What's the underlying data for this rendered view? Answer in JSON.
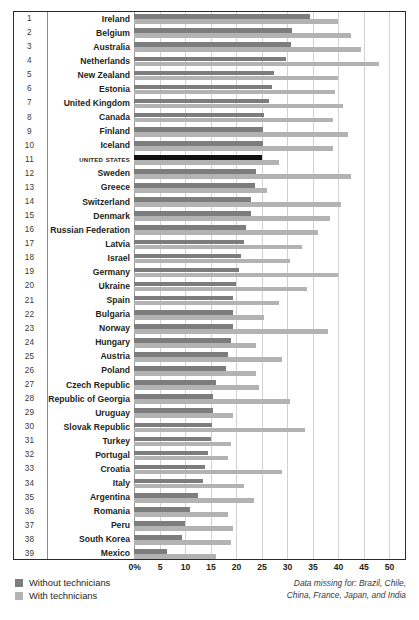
{
  "chart_data": {
    "type": "bar",
    "orientation": "horizontal",
    "title": "",
    "xlabel": "",
    "ylabel": "",
    "xlim": [
      0,
      50
    ],
    "xticks": [
      "0%",
      "5",
      "10",
      "15",
      "20",
      "25",
      "30",
      "35",
      "40",
      "45",
      "50"
    ],
    "xtick_values": [
      0,
      5,
      10,
      15,
      20,
      25,
      30,
      35,
      40,
      45,
      50
    ],
    "grid": "vertical",
    "legend_position": "bottom-left",
    "highlight_category": "United States",
    "series": [
      {
        "name": "Without technicians",
        "color": "#7d7d7d"
      },
      {
        "name": "With technicians",
        "color": "#b3b3b3"
      }
    ],
    "categories": [
      "Ireland",
      "Belgium",
      "Australia",
      "Netherlands",
      "New Zealand",
      "Estonia",
      "United Kingdom",
      "Canada",
      "Finland",
      "Iceland",
      "United States",
      "Sweden",
      "Greece",
      "Switzerland",
      "Denmark",
      "Russian Federation",
      "Latvia",
      "Israel",
      "Germany",
      "Ukraine",
      "Spain",
      "Bulgaria",
      "Norway",
      "Hungary",
      "Austria",
      "Poland",
      "Czech Republic",
      "Republic of Georgia",
      "Uruguay",
      "Slovak Republic",
      "Turkey",
      "Portugal",
      "Croatia",
      "Italy",
      "Argentina",
      "Romania",
      "Peru",
      "South Korea",
      "Mexico"
    ],
    "ranks": [
      1,
      2,
      3,
      4,
      5,
      6,
      7,
      8,
      9,
      10,
      11,
      12,
      13,
      14,
      15,
      16,
      17,
      18,
      19,
      20,
      21,
      22,
      23,
      24,
      25,
      26,
      27,
      28,
      29,
      30,
      31,
      32,
      33,
      34,
      35,
      36,
      37,
      38,
      39
    ],
    "rows": [
      {
        "rank": 1,
        "category": "Ireland",
        "without_technicians": 34.5,
        "with_technicians": 40.0
      },
      {
        "rank": 2,
        "category": "Belgium",
        "without_technicians": 31.0,
        "with_technicians": 42.5
      },
      {
        "rank": 3,
        "category": "Australia",
        "without_technicians": 30.8,
        "with_technicians": 44.5
      },
      {
        "rank": 4,
        "category": "Netherlands",
        "without_technicians": 29.8,
        "with_technicians": 48.0
      },
      {
        "rank": 5,
        "category": "New Zealand",
        "without_technicians": 27.5,
        "with_technicians": 40.0
      },
      {
        "rank": 6,
        "category": "Estonia",
        "without_technicians": 27.0,
        "with_technicians": 39.5
      },
      {
        "rank": 7,
        "category": "United Kingdom",
        "without_technicians": 26.5,
        "with_technicians": 41.0
      },
      {
        "rank": 8,
        "category": "Canada",
        "without_technicians": 25.5,
        "with_technicians": 39.0
      },
      {
        "rank": 9,
        "category": "Finland",
        "without_technicians": 25.3,
        "with_technicians": 42.0
      },
      {
        "rank": 10,
        "category": "Iceland",
        "without_technicians": 25.2,
        "with_technicians": 39.0
      },
      {
        "rank": 11,
        "category": "United States",
        "without_technicians": 25.0,
        "with_technicians": 28.5
      },
      {
        "rank": 12,
        "category": "Sweden",
        "without_technicians": 24.0,
        "with_technicians": 42.5
      },
      {
        "rank": 13,
        "category": "Greece",
        "without_technicians": 23.8,
        "with_technicians": 26.0
      },
      {
        "rank": 14,
        "category": "Switzerland",
        "without_technicians": 23.0,
        "with_technicians": 40.5
      },
      {
        "rank": 15,
        "category": "Denmark",
        "without_technicians": 23.0,
        "with_technicians": 38.5
      },
      {
        "rank": 16,
        "category": "Russian Federation",
        "without_technicians": 22.0,
        "with_technicians": 36.0
      },
      {
        "rank": 17,
        "category": "Latvia",
        "without_technicians": 21.5,
        "with_technicians": 33.0
      },
      {
        "rank": 18,
        "category": "Israel",
        "without_technicians": 21.0,
        "with_technicians": 30.5
      },
      {
        "rank": 19,
        "category": "Germany",
        "without_technicians": 20.5,
        "with_technicians": 40.0
      },
      {
        "rank": 20,
        "category": "Ukraine",
        "without_technicians": 20.0,
        "with_technicians": 34.0
      },
      {
        "rank": 21,
        "category": "Spain",
        "without_technicians": 19.5,
        "with_technicians": 28.5
      },
      {
        "rank": 22,
        "category": "Bulgaria",
        "without_technicians": 19.5,
        "with_technicians": 25.5
      },
      {
        "rank": 23,
        "category": "Norway",
        "without_technicians": 19.5,
        "with_technicians": 38.0
      },
      {
        "rank": 24,
        "category": "Hungary",
        "without_technicians": 19.0,
        "with_technicians": 24.0
      },
      {
        "rank": 25,
        "category": "Austria",
        "without_technicians": 18.5,
        "with_technicians": 29.0
      },
      {
        "rank": 26,
        "category": "Poland",
        "without_technicians": 18.0,
        "with_technicians": 24.0
      },
      {
        "rank": 27,
        "category": "Czech Republic",
        "without_technicians": 16.0,
        "with_technicians": 24.5
      },
      {
        "rank": 28,
        "category": "Republic of Georgia",
        "without_technicians": 15.5,
        "with_technicians": 30.5
      },
      {
        "rank": 29,
        "category": "Uruguay",
        "without_technicians": 15.5,
        "with_technicians": 19.5
      },
      {
        "rank": 30,
        "category": "Slovak Republic",
        "without_technicians": 15.3,
        "with_technicians": 33.5
      },
      {
        "rank": 31,
        "category": "Turkey",
        "without_technicians": 15.0,
        "with_technicians": 19.0
      },
      {
        "rank": 32,
        "category": "Portugal",
        "without_technicians": 14.5,
        "with_technicians": 18.5
      },
      {
        "rank": 33,
        "category": "Croatia",
        "without_technicians": 14.0,
        "with_technicians": 29.0
      },
      {
        "rank": 34,
        "category": "Italy",
        "without_technicians": 13.5,
        "with_technicians": 21.5
      },
      {
        "rank": 35,
        "category": "Argentina",
        "without_technicians": 12.5,
        "with_technicians": 23.5
      },
      {
        "rank": 36,
        "category": "Romania",
        "without_technicians": 11.0,
        "with_technicians": 18.5
      },
      {
        "rank": 37,
        "category": "Peru",
        "without_technicians": 10.0,
        "with_technicians": 19.5
      },
      {
        "rank": 38,
        "category": "South Korea",
        "without_technicians": 9.5,
        "with_technicians": 19.0
      },
      {
        "rank": 39,
        "category": "Mexico",
        "without_technicians": 6.5,
        "with_technicians": 16.0
      }
    ]
  },
  "legend": {
    "items": [
      {
        "label": "Without technicians",
        "color": "#7d7d7d"
      },
      {
        "label": "With technicians",
        "color": "#b3b3b3"
      }
    ]
  },
  "note": {
    "line1": "Data missing for: Brazil, Chile,",
    "line2": "China, France, Japan, and India"
  }
}
